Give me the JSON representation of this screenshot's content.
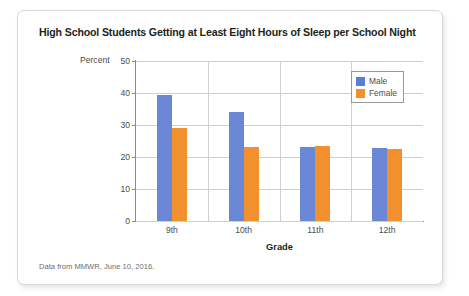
{
  "card": {
    "title": "High School Students Getting at Least Eight Hours of Sleep per School Night",
    "source_note": "Data from MMWR, June 10, 2016."
  },
  "chart_data": {
    "type": "bar",
    "title": "High School Students Getting at Least Eight Hours of Sleep per School Night",
    "categories": [
      "9th",
      "10th",
      "11th",
      "12th"
    ],
    "series": [
      {
        "name": "Male",
        "color": "#6a87d6",
        "values": [
          39.5,
          34.0,
          23.0,
          22.8
        ]
      },
      {
        "name": "Female",
        "color": "#f2902e",
        "values": [
          29.0,
          23.0,
          23.3,
          22.5
        ]
      }
    ],
    "xlabel": "Grade",
    "ylabel": "Percent",
    "ylim": [
      0,
      50
    ],
    "yticks": [
      0,
      10,
      20,
      30,
      40,
      50
    ],
    "ytick_labels": [
      "0",
      "10",
      "20",
      "30",
      "40",
      "50"
    ],
    "grid": true,
    "legend_position": "top-right"
  }
}
